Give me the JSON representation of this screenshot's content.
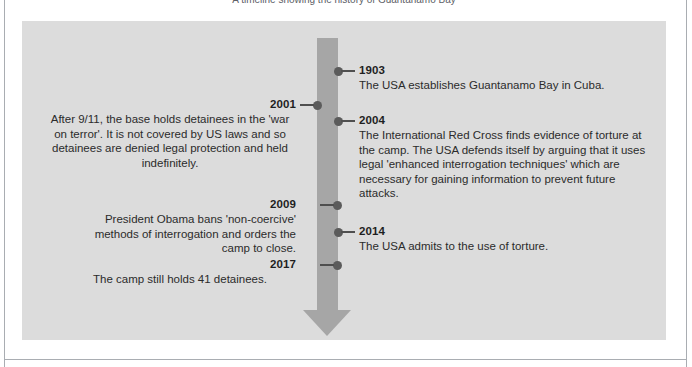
{
  "caption": {
    "text": "A timeline showing the history of Guantanamo Bay"
  },
  "colors": {
    "panel_background": "#dcdcdc",
    "arrow": "#a6a6a6",
    "dot": "#5b5b5b",
    "year_text": "#1f1f1f",
    "body_text": "#2b2b2b",
    "frame": "#a9adb2",
    "page_background": "#ffffff"
  },
  "timeline": {
    "title": "Guantanamo Bay timeline",
    "entries": [
      {
        "year": "1903",
        "side": "right",
        "description": "The USA establishes Guantanamo Bay in Cuba."
      },
      {
        "year": "2001",
        "side": "left",
        "description": "After 9/11, the base holds detainees in the 'war on terror'. It is not covered by US laws and so detainees are denied legal protection and held indefinitely."
      },
      {
        "year": "2004",
        "side": "right",
        "description": "The International Red Cross finds evidence of torture at the camp. The USA defends itself by arguing that it uses legal 'enhanced interrogation techniques' which are necessary for gaining information to prevent future attacks."
      },
      {
        "year": "2009",
        "side": "left",
        "description": "President Obama bans 'non-coercive' methods of interrogation and orders the camp to close."
      },
      {
        "year": "2014",
        "side": "right",
        "description": "The USA admits to the use of torture."
      },
      {
        "year": "2017",
        "side": "left",
        "description": "The camp still holds 41 detainees."
      }
    ]
  }
}
